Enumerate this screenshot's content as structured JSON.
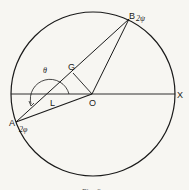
{
  "figure": {
    "caption": "Fig. 6",
    "points": {
      "A": {
        "label": "A",
        "sub": "2φ"
      },
      "B": {
        "label": "B",
        "sub": "2ψ"
      },
      "G": {
        "label": "G"
      },
      "L": {
        "label": "L"
      },
      "O": {
        "label": "O"
      },
      "X": {
        "label": "X"
      }
    },
    "angle_label": "θ"
  }
}
